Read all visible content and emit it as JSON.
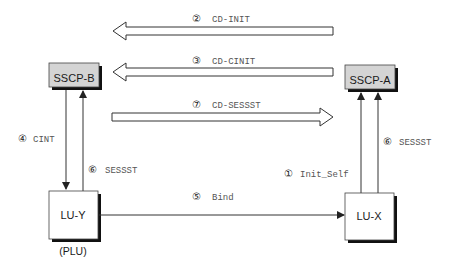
{
  "nodes": {
    "sscp_b": {
      "label": "SSCP-B",
      "fill": "#d4d4d4"
    },
    "sscp_a": {
      "label": "SSCP-A",
      "fill": "#d4d4d4"
    },
    "lu_y": {
      "label": "LU-Y",
      "sublabel": "(PLU)",
      "fill": "#ffffff"
    },
    "lu_x": {
      "label": "LU-X",
      "fill": "#ffffff"
    }
  },
  "flows": [
    {
      "step": "①",
      "label": "Init_Self",
      "from": "LU-X",
      "to": "SSCP-A"
    },
    {
      "step": "②",
      "label": "CD-INIT",
      "from": "SSCP-A",
      "to": "SSCP-B"
    },
    {
      "step": "③",
      "label": "CD-CINIT",
      "from": "SSCP-A",
      "to": "SSCP-B"
    },
    {
      "step": "④",
      "label": "CINT",
      "from": "SSCP-B",
      "to": "LU-Y"
    },
    {
      "step": "⑤",
      "label": "Bind",
      "from": "LU-Y",
      "to": "LU-X"
    },
    {
      "step": "⑥",
      "label": "SESSST",
      "from": "LU-Y",
      "to": "SSCP-B"
    },
    {
      "step": "⑥",
      "label": "SESSST",
      "from": "LU-X",
      "to": "SSCP-A"
    },
    {
      "step": "⑦",
      "label": "CD-SESSST",
      "from": "SSCP-B",
      "to": "SSCP-A"
    }
  ],
  "colors": {
    "line": "#333333",
    "shadow": "#111111",
    "gray_box": "#d4d4d4"
  }
}
